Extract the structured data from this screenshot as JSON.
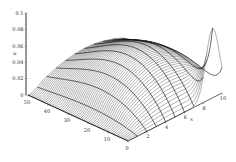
{
  "chart_data": {
    "type": "surface3d",
    "title": "",
    "axes": {
      "t": {
        "label": "",
        "ticks": [
          0,
          10,
          20,
          30,
          40,
          50
        ],
        "range": [
          0,
          50
        ]
      },
      "x": {
        "label": "x",
        "ticks": [
          2,
          4,
          6,
          8,
          10
        ],
        "range": [
          0,
          10
        ]
      },
      "u": {
        "label": "u",
        "ticks": [
          0,
          0.02,
          0.04,
          0.06,
          0.08,
          0.1
        ],
        "tick_labels": [
          "0",
          "0.02",
          "0.04",
          "0.06",
          "0.08",
          "0.1"
        ],
        "range": [
          0,
          0.1
        ]
      }
    },
    "sample_surface": {
      "t": [
        0,
        10,
        20,
        30,
        40,
        50
      ],
      "x": [
        0,
        2,
        4,
        6,
        8,
        10
      ],
      "u": [
        [
          0.0,
          0.0,
          0.002,
          0.015,
          0.07,
          0.05
        ],
        [
          0.0,
          0.008,
          0.02,
          0.038,
          0.045,
          0.035
        ],
        [
          0.0,
          0.012,
          0.028,
          0.045,
          0.05,
          0.04
        ],
        [
          0.0,
          0.012,
          0.028,
          0.045,
          0.05,
          0.045
        ],
        [
          0.0,
          0.01,
          0.022,
          0.035,
          0.04,
          0.038
        ],
        [
          0.0,
          0.006,
          0.014,
          0.022,
          0.026,
          0.025
        ]
      ]
    },
    "grid": false,
    "legend": null,
    "mesh": {
      "t_lines": 60,
      "x_lines": 11,
      "stroke": "#222222",
      "fill": "#ffffff"
    }
  }
}
